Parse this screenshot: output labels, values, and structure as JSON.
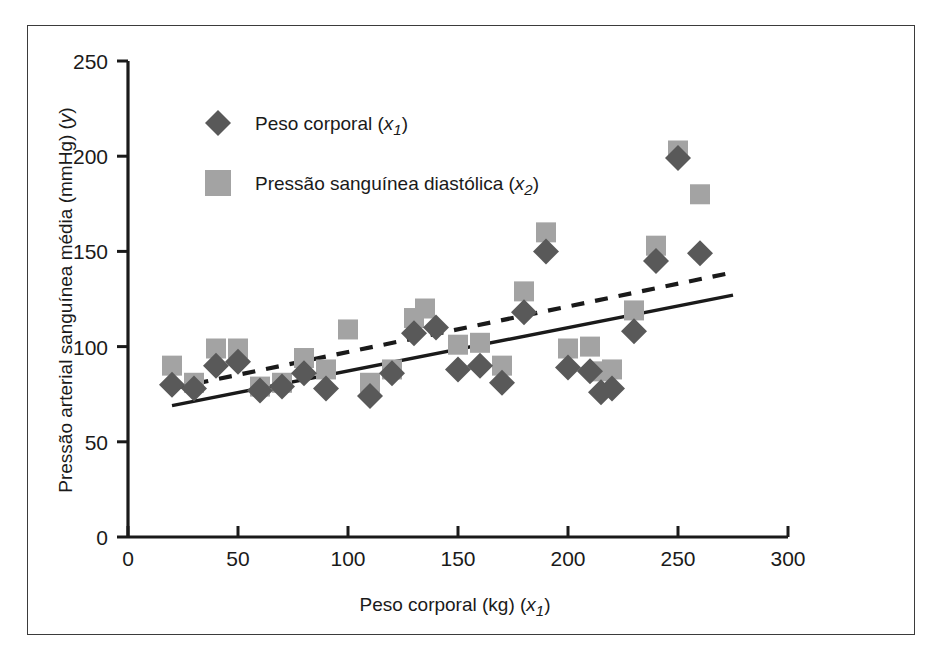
{
  "chart_data": {
    "type": "scatter",
    "title": "",
    "xlabel": "Peso corporal (kg) (x₁)",
    "ylabel": "Pressão arterial sanguínea média (mmHg) (y)",
    "xlim": [
      0,
      300
    ],
    "ylim": [
      0,
      250
    ],
    "xticks": [
      0,
      50,
      100,
      150,
      200,
      250,
      300
    ],
    "yticks": [
      0,
      50,
      100,
      150,
      200,
      250
    ],
    "grid": false,
    "legend_position": "upper-left-inside",
    "colors": {
      "series_1_marker": "#595959",
      "series_2_marker": "#a3a3a3",
      "axis": "#1a1a1a",
      "frame": "#3b3b3b",
      "trend_solid": "#1a1a1a",
      "trend_dashed": "#1a1a1a",
      "background": "#ffffff"
    },
    "series": [
      {
        "name": "Peso corporal (x₁)",
        "marker": "diamond",
        "color": "#595959",
        "points": [
          [
            20,
            80
          ],
          [
            30,
            78
          ],
          [
            40,
            90
          ],
          [
            50,
            92
          ],
          [
            60,
            77
          ],
          [
            70,
            79
          ],
          [
            80,
            86
          ],
          [
            90,
            78
          ],
          [
            110,
            74
          ],
          [
            120,
            86
          ],
          [
            130,
            107
          ],
          [
            140,
            110
          ],
          [
            150,
            88
          ],
          [
            160,
            90
          ],
          [
            170,
            81
          ],
          [
            180,
            118
          ],
          [
            190,
            150
          ],
          [
            200,
            89
          ],
          [
            210,
            87
          ],
          [
            215,
            76
          ],
          [
            220,
            78
          ],
          [
            230,
            108
          ],
          [
            240,
            145
          ],
          [
            250,
            199
          ],
          [
            260,
            149
          ]
        ]
      },
      {
        "name": "Pressão sanguínea diastólica (x₂)",
        "marker": "square",
        "color": "#a3a3a3",
        "points": [
          [
            20,
            90
          ],
          [
            30,
            81
          ],
          [
            40,
            99
          ],
          [
            50,
            99
          ],
          [
            60,
            79
          ],
          [
            70,
            81
          ],
          [
            80,
            94
          ],
          [
            90,
            88
          ],
          [
            100,
            109
          ],
          [
            110,
            81
          ],
          [
            120,
            88
          ],
          [
            130,
            115
          ],
          [
            135,
            120
          ],
          [
            150,
            101
          ],
          [
            160,
            102
          ],
          [
            170,
            90
          ],
          [
            180,
            129
          ],
          [
            190,
            160
          ],
          [
            200,
            99
          ],
          [
            210,
            100
          ],
          [
            215,
            87
          ],
          [
            220,
            88
          ],
          [
            230,
            119
          ],
          [
            240,
            153
          ],
          [
            250,
            203
          ],
          [
            260,
            180
          ]
        ]
      }
    ],
    "trendlines": [
      {
        "name": "solid-trendline",
        "style": "solid",
        "x_start": 20,
        "y_start": 69,
        "x_end": 275,
        "y_end": 127
      },
      {
        "name": "dashed-trendline",
        "style": "dashed",
        "x_start": 20,
        "y_start": 78,
        "x_end": 275,
        "y_end": 139
      }
    ]
  },
  "legend": {
    "items": [
      {
        "marker": "diamond",
        "label_main": "Peso corporal (",
        "label_sub": "x",
        "label_subscript": "1",
        "label_tail": ")"
      },
      {
        "marker": "square",
        "label_main": "Pressão sanguínea diastólica (",
        "label_sub": "x",
        "label_subscript": "2",
        "label_tail": ")"
      }
    ]
  },
  "axes": {
    "x_title_main": "Peso corporal (kg) (",
    "x_title_var": "x",
    "x_title_sub": "1",
    "x_title_tail": ")",
    "y_title": "Pressão arterial sanguínea média (mmHg) (",
    "y_title_var": "y",
    "y_title_tail": ")",
    "x_tick_labels": [
      "0",
      "50",
      "100",
      "150",
      "200",
      "250",
      "300"
    ],
    "y_tick_labels": [
      "0",
      "50",
      "100",
      "150",
      "200",
      "250"
    ]
  }
}
